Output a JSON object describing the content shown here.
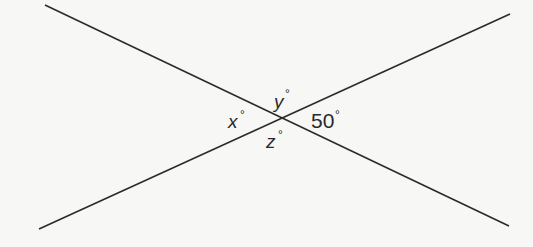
{
  "diagram": {
    "lines": [
      {
        "name": "line-descending",
        "x1": 45,
        "y1": 5,
        "x2": 509,
        "y2": 226
      },
      {
        "name": "line-ascending",
        "x1": 39,
        "y1": 229,
        "x2": 510,
        "y2": 14
      }
    ],
    "intersection": {
      "x": 276,
      "y": 118
    },
    "line_color": "#2b2b2b",
    "labels": {
      "x": {
        "text": "x",
        "degree": "°"
      },
      "y": {
        "text": "y",
        "degree": "°"
      },
      "z": {
        "text": "z",
        "degree": "°"
      },
      "given": {
        "text": "50",
        "degree": "°"
      }
    }
  }
}
